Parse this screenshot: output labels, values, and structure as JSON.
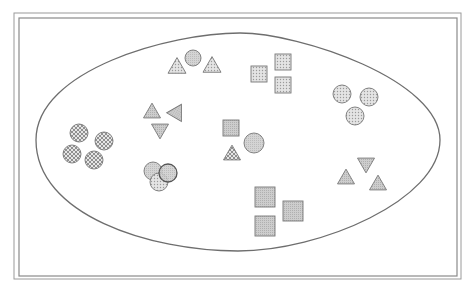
{
  "diagram": {
    "width": 471,
    "height": 291,
    "background": "#ffffff",
    "frame": {
      "outer": {
        "x": 14,
        "y": 13,
        "w": 447,
        "h": 266
      },
      "inner": {
        "x": 19,
        "y": 18,
        "w": 438,
        "h": 258
      },
      "color": "#8a8a8a"
    },
    "boundary": {
      "shape": "egg-ellipse",
      "path": "M 36 140 C 36 70, 170 33, 240 33 C 300 33, 440 80, 440 140 C 440 200, 320 251, 238 251 C 150 251, 36 215, 36 140 Z",
      "stroke": "#6e6e6e"
    },
    "fills": {
      "dots_light": "#d0d0d0",
      "gray": "#c4c4c4",
      "crosshatch": "#bdbdbd"
    },
    "clusters": [
      {
        "id": "top-triangles-circle",
        "shapes": [
          {
            "type": "triangle",
            "cx": 177,
            "cy": 67,
            "size": 18,
            "fill": "dots_light"
          },
          {
            "type": "circle",
            "cx": 193,
            "cy": 58,
            "r": 8,
            "fill": "gray"
          },
          {
            "type": "triangle",
            "cx": 212,
            "cy": 66,
            "size": 18,
            "fill": "dots_light"
          }
        ]
      },
      {
        "id": "top-squares",
        "shapes": [
          {
            "type": "square",
            "cx": 259,
            "cy": 74,
            "size": 16,
            "fill": "dots_light"
          },
          {
            "type": "square",
            "cx": 283,
            "cy": 62,
            "size": 16,
            "fill": "dots_light"
          },
          {
            "type": "square",
            "cx": 283,
            "cy": 85,
            "size": 16,
            "fill": "dots_light"
          }
        ]
      },
      {
        "id": "right-circles",
        "shapes": [
          {
            "type": "circle",
            "cx": 342,
            "cy": 94,
            "r": 9,
            "fill": "dots_light"
          },
          {
            "type": "circle",
            "cx": 369,
            "cy": 97,
            "r": 9,
            "fill": "dots_light"
          },
          {
            "type": "circle",
            "cx": 355,
            "cy": 116,
            "r": 9,
            "fill": "dots_light"
          }
        ]
      },
      {
        "id": "left-crosshatch-circles",
        "shapes": [
          {
            "type": "circle",
            "cx": 79,
            "cy": 133,
            "r": 9,
            "fill": "crosshatch"
          },
          {
            "type": "circle",
            "cx": 104,
            "cy": 141,
            "r": 9,
            "fill": "crosshatch"
          },
          {
            "type": "circle",
            "cx": 72,
            "cy": 154,
            "r": 9,
            "fill": "crosshatch"
          },
          {
            "type": "circle",
            "cx": 94,
            "cy": 160,
            "r": 9,
            "fill": "crosshatch"
          }
        ]
      },
      {
        "id": "rotated-triangles",
        "shapes": [
          {
            "type": "triangle",
            "cx": 152,
            "cy": 112,
            "size": 17,
            "rotate": 0,
            "fill": "gray"
          },
          {
            "type": "triangle",
            "cx": 177,
            "cy": 112,
            "size": 17,
            "rotate": 30,
            "fill": "gray"
          },
          {
            "type": "triangle",
            "cx": 160,
            "cy": 130,
            "size": 17,
            "rotate": 180,
            "fill": "gray"
          }
        ]
      },
      {
        "id": "overlapping-circles",
        "shapes": [
          {
            "type": "circle",
            "cx": 153,
            "cy": 171,
            "r": 9,
            "fill": "gray"
          },
          {
            "type": "circle",
            "cx": 159,
            "cy": 182,
            "r": 9,
            "fill": "dots_light"
          },
          {
            "type": "circle",
            "cx": 168,
            "cy": 173,
            "r": 9,
            "fill": "gray",
            "dark_stroke": true
          }
        ]
      },
      {
        "id": "center-mixed",
        "shapes": [
          {
            "type": "square",
            "cx": 231,
            "cy": 128,
            "size": 16,
            "fill": "gray"
          },
          {
            "type": "circle",
            "cx": 254,
            "cy": 143,
            "r": 10,
            "fill": "gray"
          },
          {
            "type": "triangle",
            "cx": 232,
            "cy": 154,
            "size": 17,
            "fill": "crosshatch"
          }
        ]
      },
      {
        "id": "bottom-squares",
        "shapes": [
          {
            "type": "square",
            "cx": 265,
            "cy": 197,
            "size": 20,
            "fill": "gray"
          },
          {
            "type": "square",
            "cx": 293,
            "cy": 211,
            "size": 20,
            "fill": "gray"
          },
          {
            "type": "square",
            "cx": 265,
            "cy": 226,
            "size": 20,
            "fill": "gray"
          }
        ]
      },
      {
        "id": "right-triangles",
        "shapes": [
          {
            "type": "triangle",
            "cx": 346,
            "cy": 178,
            "size": 17,
            "rotate": 0,
            "fill": "gray"
          },
          {
            "type": "triangle",
            "cx": 366,
            "cy": 164,
            "size": 17,
            "rotate": 180,
            "fill": "gray"
          },
          {
            "type": "triangle",
            "cx": 378,
            "cy": 184,
            "size": 17,
            "rotate": 0,
            "fill": "gray"
          }
        ]
      }
    ]
  }
}
